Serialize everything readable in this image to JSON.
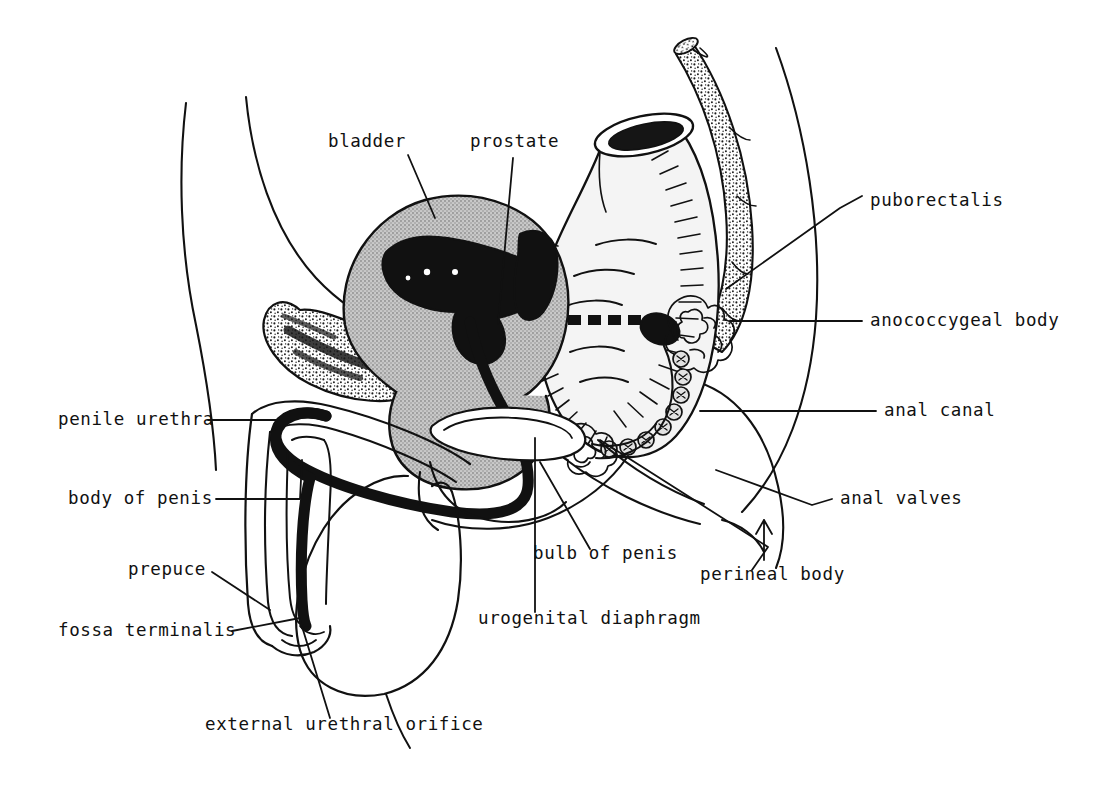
{
  "figure": {
    "background_color": "#ffffff",
    "ink_color": "#111111",
    "fill_colors": {
      "bladder_gray": "#b0b0b0",
      "prostate_black": "#111111",
      "urethra_black": "#111111",
      "rectum_lumen": "#f2f2f2",
      "bone_stipple": "#ffffff"
    }
  },
  "labels": [
    {
      "id": "bladder",
      "text": "bladder",
      "x": 328,
      "y": 143,
      "align": "start"
    },
    {
      "id": "prostate",
      "text": "prostate",
      "x": 470,
      "y": 143,
      "align": "start"
    },
    {
      "id": "puborectalis",
      "text": "puborectalis",
      "x": 870,
      "y": 202,
      "align": "start"
    },
    {
      "id": "anococcygeal-body",
      "text": "anococcygeal body",
      "x": 870,
      "y": 327,
      "align": "start"
    },
    {
      "id": "anal-canal",
      "text": "anal canal",
      "x": 884,
      "y": 417,
      "align": "start"
    },
    {
      "id": "anal-valves",
      "text": "anal valves",
      "x": 840,
      "y": 505,
      "align": "start"
    },
    {
      "id": "penile-urethra",
      "text": "penile urethra",
      "x": 58,
      "y": 426,
      "align": "start"
    },
    {
      "id": "body-of-penis",
      "text": "body of penis",
      "x": 68,
      "y": 505,
      "align": "start"
    },
    {
      "id": "prepuce",
      "text": "prepuce",
      "x": 128,
      "y": 572,
      "align": "start"
    },
    {
      "id": "fossa-terminalis",
      "text": "fossa terminalis",
      "x": 58,
      "y": 637,
      "align": "start"
    },
    {
      "id": "bulb-of-penis",
      "text": "bulb of penis",
      "x": 533,
      "y": 559,
      "align": "start"
    },
    {
      "id": "perineal-body",
      "text": "perineal body",
      "x": 700,
      "y": 580,
      "align": "start"
    },
    {
      "id": "urogenital-diaphragm",
      "text": "urogenital diaphragm",
      "x": 478,
      "y": 624,
      "align": "start"
    },
    {
      "id": "external-urethral-orifice",
      "text": "external urethral orifice",
      "x": 205,
      "y": 730,
      "align": "start"
    }
  ],
  "leader_lines": [
    {
      "id": "bladder",
      "path": "M 408 155 L 435 218"
    },
    {
      "id": "prostate",
      "path": "M 513 158 L 498 324"
    },
    {
      "id": "puborectalis",
      "path": "M 862 196 L 840 208 L 726 289"
    },
    {
      "id": "anococcygeal-body",
      "path": "M 862 321 L 730 321"
    },
    {
      "id": "anal-canal",
      "path": "M 876 411 L 700 411"
    },
    {
      "id": "anal-valves",
      "path": "M 832 499 L 812 505 L 716 470"
    },
    {
      "id": "penile-urethra",
      "path": "M 208 420 L 290 420"
    },
    {
      "id": "body-of-penis",
      "path": "M 216 499 L 300 499 L 302 460"
    },
    {
      "id": "prepuce",
      "path": "M 212 572 L 270 610"
    },
    {
      "id": "fossa-terminalis",
      "path": "M 232 631 L 300 618"
    },
    {
      "id": "bulb-of-penis",
      "path": "M 590 549 L 540 462"
    },
    {
      "id": "perineal-body",
      "path": "M 752 570 L 768 547 L 600 440"
    },
    {
      "id": "urogenital-diaphragm",
      "path": "M 535 612 L 535 438"
    },
    {
      "id": "external-urethral-orifice",
      "path": "M 330 718 L 300 620"
    }
  ],
  "structures": [
    {
      "id": "abdominal-wall",
      "name": "abdominal wall outline"
    },
    {
      "id": "bladder",
      "name": "urinary bladder"
    },
    {
      "id": "prostate",
      "name": "prostate gland"
    },
    {
      "id": "pubic-bone",
      "name": "pubic bone (stippled)"
    },
    {
      "id": "urethra",
      "name": "urethra"
    },
    {
      "id": "rectum",
      "name": "rectum"
    },
    {
      "id": "sacrum-coccyx",
      "name": "sacrum and coccyx (stippled)"
    },
    {
      "id": "pectinate-line",
      "name": "pectinate / dentate line"
    },
    {
      "id": "puborectalis-muscle",
      "name": "puborectalis sling"
    },
    {
      "id": "anococcygeal-body",
      "name": "anococcygeal body"
    },
    {
      "id": "perineal-body",
      "name": "perineal body"
    },
    {
      "id": "anal-sphincter",
      "name": "anal sphincter rings"
    },
    {
      "id": "penis",
      "name": "penis (body, prepuce, glans)"
    },
    {
      "id": "scrotum",
      "name": "scrotum"
    },
    {
      "id": "buttock",
      "name": "buttock / gluteal outline"
    },
    {
      "id": "urogenital-diaphragm",
      "name": "urogenital diaphragm"
    },
    {
      "id": "bulb-of-penis",
      "name": "bulb of penis"
    }
  ]
}
